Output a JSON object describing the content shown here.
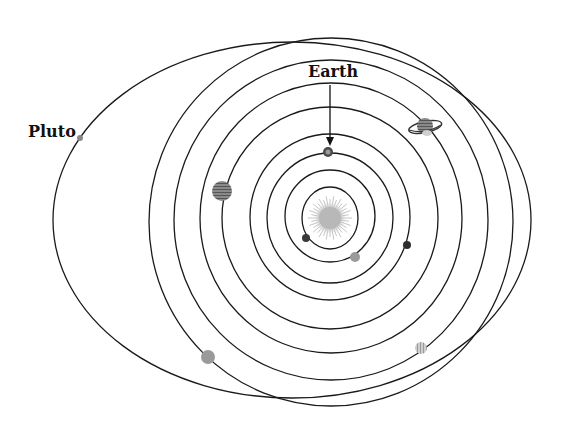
{
  "labels": {
    "earth": "Earth",
    "pluto": "Pluto"
  },
  "colors": {
    "background": "#ffffff",
    "orbit_stroke": "#1a1a1a",
    "sun": "#b8b8b8",
    "planet_gray": "#8a8a8a",
    "planet_dark": "#3a3a3a"
  },
  "sun": {
    "cx": 330,
    "cy": 218,
    "r": 16
  },
  "orbits": [
    {
      "name": "mercury-orbit",
      "cx": 330,
      "cy": 218,
      "rx": 28,
      "ry": 31
    },
    {
      "name": "venus-orbit",
      "cx": 330,
      "cy": 216,
      "rx": 45,
      "ry": 46
    },
    {
      "name": "earth-orbit",
      "cx": 330,
      "cy": 218,
      "rx": 63,
      "ry": 65
    },
    {
      "name": "mars-orbit",
      "cx": 330,
      "cy": 217,
      "rx": 80,
      "ry": 83
    },
    {
      "name": "jupiter-orbit",
      "cx": 330,
      "cy": 218,
      "rx": 108,
      "ry": 111
    },
    {
      "name": "saturn-orbit",
      "cx": 331,
      "cy": 218,
      "rx": 131,
      "ry": 135
    },
    {
      "name": "uranus-orbit",
      "cx": 331,
      "cy": 220,
      "rx": 157,
      "ry": 160
    },
    {
      "name": "neptune-orbit",
      "cx": 331,
      "cy": 222,
      "rx": 182,
      "ry": 184
    },
    {
      "name": "pluto-orbit",
      "cx": 292,
      "cy": 220,
      "rx": 239,
      "ry": 178
    }
  ],
  "planets": [
    {
      "name": "mercury",
      "cx": 306,
      "cy": 238,
      "r": 4,
      "fill": "#3a3a3a"
    },
    {
      "name": "venus",
      "cx": 355,
      "cy": 257,
      "r": 5,
      "fill": "#9a9a9a"
    },
    {
      "name": "earth",
      "cx": 328,
      "cy": 152,
      "r": 5,
      "fill": "#4a4a4a"
    },
    {
      "name": "mars",
      "cx": 407,
      "cy": 245,
      "r": 4,
      "fill": "#2e2e2e"
    },
    {
      "name": "jupiter",
      "cx": 222,
      "cy": 191,
      "r": 10,
      "fill": "#777777"
    },
    {
      "name": "saturn",
      "cx": 425,
      "cy": 126,
      "r": 8,
      "fill": "#666666"
    },
    {
      "name": "uranus",
      "cx": 421,
      "cy": 348,
      "r": 6,
      "fill": "#bdbdbd"
    },
    {
      "name": "neptune",
      "cx": 208,
      "cy": 357,
      "r": 7,
      "fill": "#9a9a9a"
    },
    {
      "name": "pluto",
      "cx": 80,
      "cy": 138,
      "r": 3,
      "fill": "#888888"
    }
  ],
  "arrow": {
    "x": 330,
    "y1": 85,
    "y2": 146
  }
}
